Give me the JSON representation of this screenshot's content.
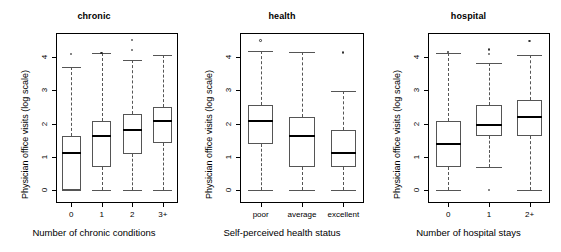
{
  "figure": {
    "width": 561,
    "height": 252,
    "background": "#ffffff",
    "shared_ylabel": "Physician office visits (log scale)",
    "axis_color": "#000000",
    "box_color": "#555555",
    "median_color": "#000000"
  },
  "chart_data": {
    "type": "box",
    "title": "",
    "ylabel": "Physician office visits (log scale)",
    "ylim": [
      -0.35,
      4.6
    ],
    "yticks": [
      0,
      1,
      2,
      3,
      4
    ],
    "ytick_labels": [
      "0",
      "1",
      "2",
      "3",
      "4"
    ],
    "grid": false,
    "legend": null,
    "panels": [
      {
        "title": "chronic",
        "xlabel": "Number of chronic conditions",
        "categories": [
          "0",
          "1",
          "2",
          "3+"
        ],
        "boxes": [
          {
            "category": "0",
            "whisker_low": 0.0,
            "q1": 0.0,
            "median": 1.1,
            "q3": 1.63,
            "whisker_high": 3.7,
            "outliers": [
              4.09
            ]
          },
          {
            "category": "1",
            "whisker_low": 0.0,
            "q1": 0.7,
            "median": 1.62,
            "q3": 2.08,
            "whisker_high": 4.11,
            "outliers": [
              4.12
            ]
          },
          {
            "category": "2",
            "whisker_low": 0.0,
            "q1": 1.08,
            "median": 1.8,
            "q3": 2.3,
            "whisker_high": 3.92,
            "outliers": [
              4.2,
              4.5
            ]
          },
          {
            "category": "3+",
            "whisker_low": 0.0,
            "q1": 1.4,
            "median": 2.08,
            "q3": 2.5,
            "whisker_high": 4.05,
            "outliers": []
          }
        ]
      },
      {
        "title": "health",
        "xlabel": "Self-perceived health status",
        "categories": [
          "poor",
          "average",
          "excellent"
        ],
        "boxes": [
          {
            "category": "poor",
            "whisker_low": 0.0,
            "q1": 1.39,
            "median": 2.08,
            "q3": 2.56,
            "whisker_high": 4.17,
            "outliers": [
              4.49
            ]
          },
          {
            "category": "average",
            "whisker_low": 0.0,
            "q1": 0.69,
            "median": 1.63,
            "q3": 2.2,
            "whisker_high": 4.14,
            "outliers": []
          },
          {
            "category": "excellent",
            "whisker_low": 0.0,
            "q1": 0.69,
            "median": 1.1,
            "q3": 1.81,
            "whisker_high": 2.99,
            "outliers": [
              4.13
            ]
          }
        ]
      },
      {
        "title": "hospital",
        "xlabel": "Number of hospital stays",
        "categories": [
          "0",
          "1",
          "2+"
        ],
        "boxes": [
          {
            "category": "0",
            "whisker_low": 0.0,
            "q1": 0.69,
            "median": 1.39,
            "q3": 2.08,
            "whisker_high": 4.11,
            "outliers": [
              4.14
            ]
          },
          {
            "category": "1",
            "whisker_low": 0.69,
            "q1": 1.61,
            "median": 1.95,
            "q3": 2.56,
            "whisker_high": 3.81,
            "outliers": [
              4.09,
              4.22,
              0.0
            ]
          },
          {
            "category": "2+",
            "whisker_low": 0.0,
            "q1": 1.61,
            "median": 2.2,
            "q3": 2.71,
            "whisker_high": 4.05,
            "outliers": [
              4.48
            ]
          }
        ]
      }
    ]
  }
}
